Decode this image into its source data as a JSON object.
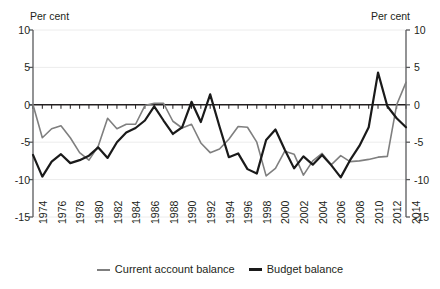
{
  "chart_data": {
    "type": "line",
    "title": "",
    "xlabel": "",
    "ylabel": "Per cent",
    "ylabel_right": "Per cent",
    "ylim": [
      -15,
      10
    ],
    "yticks": [
      10,
      5,
      0,
      -5,
      -10,
      -15
    ],
    "ytick_labels": [
      "10",
      "5",
      "0",
      "-5",
      "-10",
      "-15"
    ],
    "xlim": [
      1974,
      2014
    ],
    "grid": true,
    "grid_axis": "y",
    "legend_position": "bottom",
    "x": [
      1974,
      1975,
      1976,
      1977,
      1978,
      1979,
      1980,
      1981,
      1982,
      1983,
      1984,
      1985,
      1986,
      1987,
      1988,
      1989,
      1990,
      1991,
      1992,
      1993,
      1994,
      1995,
      1996,
      1997,
      1998,
      1999,
      2000,
      2001,
      2002,
      2003,
      2004,
      2005,
      2006,
      2007,
      2008,
      2009,
      2010,
      2011,
      2012,
      2013,
      2014
    ],
    "xtick_labels": [
      "1974",
      "1976",
      "1978",
      "1980",
      "1982",
      "1984",
      "1986",
      "1988",
      "1990",
      "1992",
      "1994",
      "1996",
      "1998",
      "2000",
      "2002",
      "2004",
      "2006",
      "2008",
      "2010",
      "2012",
      "2014"
    ],
    "series": [
      {
        "name": "Current account balance",
        "color": "#7f7f7f",
        "width": 1.6,
        "values": [
          0.0,
          -4.4,
          -3.2,
          -2.8,
          -4.4,
          -6.4,
          -7.4,
          -5.5,
          -1.8,
          -3.2,
          -2.6,
          -2.6,
          -0.1,
          0.2,
          0.2,
          -2.2,
          -3.1,
          -2.6,
          -5.1,
          -6.4,
          -5.9,
          -4.6,
          -2.9,
          -3.0,
          -5.0,
          -9.5,
          -8.5,
          -6.2,
          -6.6,
          -9.4,
          -7.5,
          -6.5,
          -8.0,
          -6.8,
          -7.6,
          -7.5,
          -7.3,
          -7.0,
          -6.9,
          0.0,
          3.0
        ]
      },
      {
        "name": "Budget balance",
        "color": "#1a1a1a",
        "width": 2.2,
        "values": [
          -6.7,
          -9.6,
          -7.6,
          -6.6,
          -7.8,
          -7.4,
          -6.8,
          -5.7,
          -7.1,
          -5.0,
          -3.7,
          -3.1,
          -2.1,
          -0.2,
          -2.1,
          -3.9,
          -3.0,
          0.4,
          -2.3,
          1.4,
          -2.9,
          -7.0,
          -6.5,
          -8.6,
          -9.2,
          -4.7,
          -3.3,
          -6.0,
          -8.5,
          -6.9,
          -8.0,
          -6.7,
          -8.1,
          -9.7,
          -7.4,
          -5.5,
          -3.0,
          4.3,
          -0.2,
          -1.8,
          -3.0
        ]
      }
    ]
  },
  "legend": {
    "items": [
      {
        "label": "Current account balance"
      },
      {
        "label": "Budget balance"
      }
    ]
  }
}
